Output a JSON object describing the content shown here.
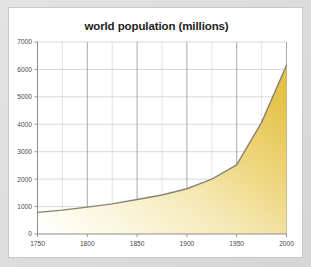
{
  "frame": {
    "background_color": "#dcdcdc",
    "card_color": "#ffffff",
    "border_color": "#c9c9c9"
  },
  "chart_data": {
    "type": "area",
    "title": "world population (millions)",
    "subtitle": "",
    "xlabel": "",
    "ylabel": "",
    "xlim": [
      1750,
      2000
    ],
    "ylim": [
      0,
      7000
    ],
    "grid": true,
    "legend": "none",
    "x_ticks": [
      1750,
      1800,
      1850,
      1900,
      1950,
      2000
    ],
    "x_tick_labels": [
      "1750",
      "1800",
      "1850",
      "1900",
      "1950",
      "2000"
    ],
    "x_minor_ticks": [
      1775,
      1825,
      1875,
      1925,
      1975
    ],
    "y_ticks": [
      0,
      1000,
      2000,
      3000,
      4000,
      5000,
      6000,
      7000
    ],
    "y_tick_labels": [
      "0",
      "1000",
      "2000",
      "3000",
      "4000",
      "5000",
      "6000",
      "7000"
    ],
    "x": [
      1750,
      1775,
      1800,
      1825,
      1850,
      1875,
      1900,
      1925,
      1950,
      1975,
      2000
    ],
    "values": [
      790,
      870,
      980,
      1100,
      1260,
      1420,
      1650,
      2000,
      2520,
      4070,
      6150
    ],
    "series": [
      {
        "name": "world population",
        "values": [
          790,
          870,
          980,
          1100,
          1260,
          1420,
          1650,
          2000,
          2520,
          4070,
          6150
        ]
      }
    ],
    "line_color": "#8a8272",
    "fill_gradient_start": "#fdfdf7",
    "fill_gradient_end": "#e5c44a",
    "gridline_color": "#cfcfcf",
    "major_gridline_color": "#9a9a9a",
    "axis_color": "#8d8d8d"
  }
}
